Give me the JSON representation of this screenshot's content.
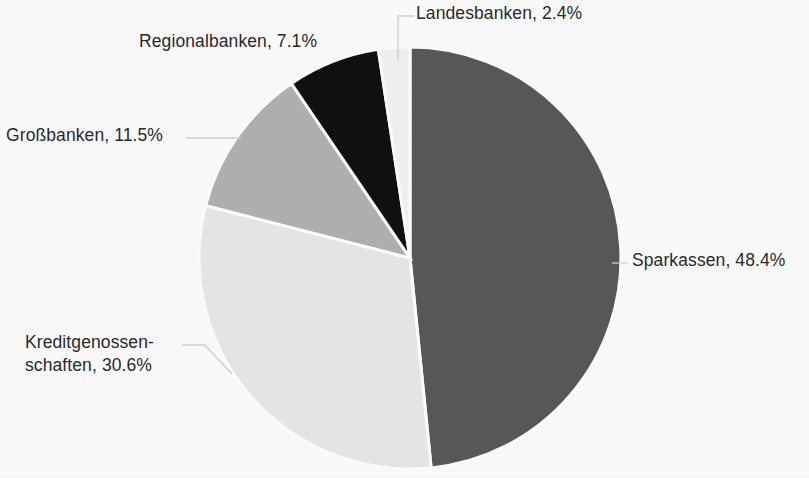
{
  "chart_data": {
    "type": "pie",
    "title": "",
    "subtitle": "",
    "xlabel": "",
    "ylabel": "",
    "legend_position": "none",
    "labels_position": "outside-with-leader-lines",
    "unit": "%",
    "start_angle_deg": 0,
    "direction": "clockwise",
    "categories": [
      "Sparkassen",
      "Kreditgenossenschaften",
      "Großbanken",
      "Regionalbanken",
      "Landesbanken"
    ],
    "values": [
      48.4,
      30.6,
      11.5,
      7.1,
      2.4
    ],
    "slices": [
      {
        "name": "Sparkassen",
        "value": 48.4,
        "label": "Sparkassen, 48.4%",
        "color": "#595959",
        "start_deg": 0,
        "end_deg": 174.24
      },
      {
        "name": "Kreditgenossenschaften",
        "value": 30.6,
        "label_line1": "Kreditgenossen-",
        "label_line2": "schaften, 30.6%",
        "label": "Kreditgenossenschaften, 30.6%",
        "color": "#e9e9e9",
        "start_deg": 174.24,
        "end_deg": 284.4
      },
      {
        "name": "Großbanken",
        "value": 11.5,
        "label": "Großbanken, 11.5%",
        "color": "#b2b2b2",
        "start_deg": 284.4,
        "end_deg": 325.8
      },
      {
        "name": "Regionalbanken",
        "value": 7.1,
        "label": "Regionalbanken, 7.1%",
        "color": "#111111",
        "start_deg": 325.8,
        "end_deg": 351.36
      },
      {
        "name": "Landesbanken",
        "value": 2.4,
        "label": "Landesbanken, 2.4%",
        "color": "#f3f3f3",
        "start_deg": 351.36,
        "end_deg": 360
      }
    ],
    "slice_border_color": "#ffffff",
    "background_color": "#fdfdfd",
    "text_color": "#2b2b2b",
    "leader_line_color": "#d2d2d2"
  },
  "labels": {
    "landesbanken": "Landesbanken, 2.4%",
    "regionalbanken": "Regionalbanken, 7.1%",
    "grossbanken": "Großbanken, 11.5%",
    "kreditgenossenschaften_line1": "Kreditgenossen-",
    "kreditgenossenschaften_line2": "schaften, 30.6%",
    "sparkassen": "Sparkassen, 48.4%"
  }
}
